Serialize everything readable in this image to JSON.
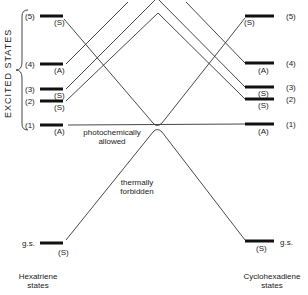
{
  "diagram": {
    "type": "orbital-correlation-diagram",
    "side_label": "EXCITED STATES",
    "left_column": {
      "title_line1": "Hexatriene",
      "title_line2": "states",
      "levels": [
        {
          "id": "(5)",
          "sym": "(S)"
        },
        {
          "id": "(4)",
          "sym": "(A)"
        },
        {
          "id": "(3)",
          "sym": "(S)"
        },
        {
          "id": "(2)",
          "sym": "(S)"
        },
        {
          "id": "(1)",
          "sym": "(A)"
        },
        {
          "id": "g.s.",
          "sym": "(S)"
        }
      ]
    },
    "right_column": {
      "title_line1": "Cyclohexadiene",
      "title_line2": "states",
      "levels": [
        {
          "id": "(5)",
          "sym": "(S)"
        },
        {
          "id": "(4)",
          "sym": "(A)"
        },
        {
          "id": "(3)",
          "sym": "(S)"
        },
        {
          "id": "(2)",
          "sym": "(S)"
        },
        {
          "id": "(1)",
          "sym": "(A)"
        },
        {
          "id": "g.s.",
          "sym": "(S)"
        }
      ]
    },
    "annotations": {
      "photo_line1": "photochemically",
      "photo_line2": "allowed",
      "thermal_line1": "thermally",
      "thermal_line2": "forbidden"
    }
  }
}
